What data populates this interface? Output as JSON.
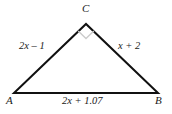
{
  "figure": {
    "type": "right-triangle-diagram",
    "background_color": "#ffffff",
    "stroke_color": "#111111",
    "right_angle_marker_color": "#cccccc",
    "vertices": {
      "A": {
        "label": "A",
        "x": 14,
        "y": 93
      },
      "B": {
        "label": "B",
        "x": 158,
        "y": 93
      },
      "C": {
        "label": "C",
        "x": 86,
        "y": 24
      }
    },
    "sides": {
      "AC": {
        "label": "2x – 1"
      },
      "CB": {
        "label": "x + 2"
      },
      "AB": {
        "label": "2x + 1.07"
      }
    },
    "right_angle_at": "C"
  }
}
